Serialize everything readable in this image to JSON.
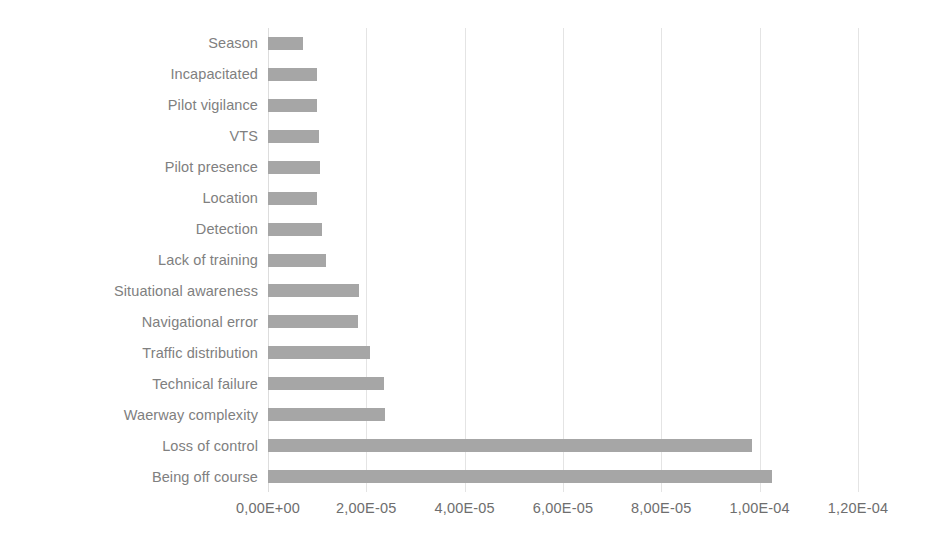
{
  "chart_data": {
    "type": "bar",
    "orientation": "horizontal",
    "title": "",
    "xlabel": "",
    "ylabel": "",
    "xlim": [
      0,
      0.00012
    ],
    "grid": true,
    "legend": false,
    "bar_color": "#a6a6a6",
    "label_color": "#808080",
    "gridline_color": "#e4e4e4",
    "background": "#ffffff",
    "x_tick_labels": [
      "0,00E+00",
      "2,00E-05",
      "4,00E-05",
      "6,00E-05",
      "8,00E-05",
      "1,00E-04",
      "1,20E-04"
    ],
    "x_tick_values": [
      0,
      2e-05,
      4e-05,
      6e-05,
      8e-05,
      0.0001,
      0.00012
    ],
    "categories": [
      "Season",
      "Incapacitated",
      "Pilot vigilance",
      "VTS",
      "Pilot presence",
      "Location",
      "Detection",
      "Lack of training",
      "Situational awareness",
      "Navigational error",
      "Traffic distribution",
      "Technical failure",
      "Waerway complexity",
      "Loss of control",
      "Being off course"
    ],
    "values": [
      7.1e-06,
      1e-05,
      1e-05,
      1.04e-05,
      1.06e-05,
      1e-05,
      1.1e-05,
      1.18e-05,
      1.85e-05,
      1.83e-05,
      2.08e-05,
      2.36e-05,
      2.38e-05,
      9.85e-05,
      0.0001025
    ]
  }
}
